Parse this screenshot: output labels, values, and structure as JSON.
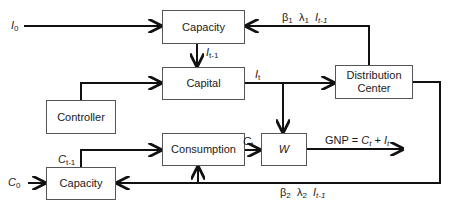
{
  "boxes": {
    "capacity_top": "Capacity",
    "capital": "Capital",
    "distribution_center_line1": "Distribution",
    "distribution_center_line2": "Center",
    "controller": "Controller",
    "consumption": "Consumption",
    "w": "W",
    "capacity_bottom": "Capacity"
  },
  "labels": {
    "I0": {
      "base": "I",
      "sub": "0"
    },
    "C0": {
      "base": "C",
      "sub": "0"
    },
    "I_t_minus_1": {
      "base": "I",
      "sub": "t-1"
    },
    "I_t": {
      "base": "I",
      "sub": "t"
    },
    "C_t_minus_1": {
      "base": "C",
      "sub": "t-1"
    },
    "C_t": {
      "base": "C",
      "sub": "t"
    },
    "feedback_top": {
      "beta": "β",
      "beta_sub": "1",
      "lambda": "λ",
      "lambda_sub": "1",
      "I": "I",
      "I_sub": "t-1"
    },
    "feedback_bottom": {
      "beta": "β",
      "beta_sub": "2",
      "lambda": "λ",
      "lambda_sub": "2",
      "I": "I",
      "I_sub": "t-1"
    },
    "gnp": {
      "prefix": "GNP = ",
      "c": "C",
      "c_sub": "t",
      "plus": " + ",
      "i": "I",
      "i_sub": "t"
    }
  }
}
